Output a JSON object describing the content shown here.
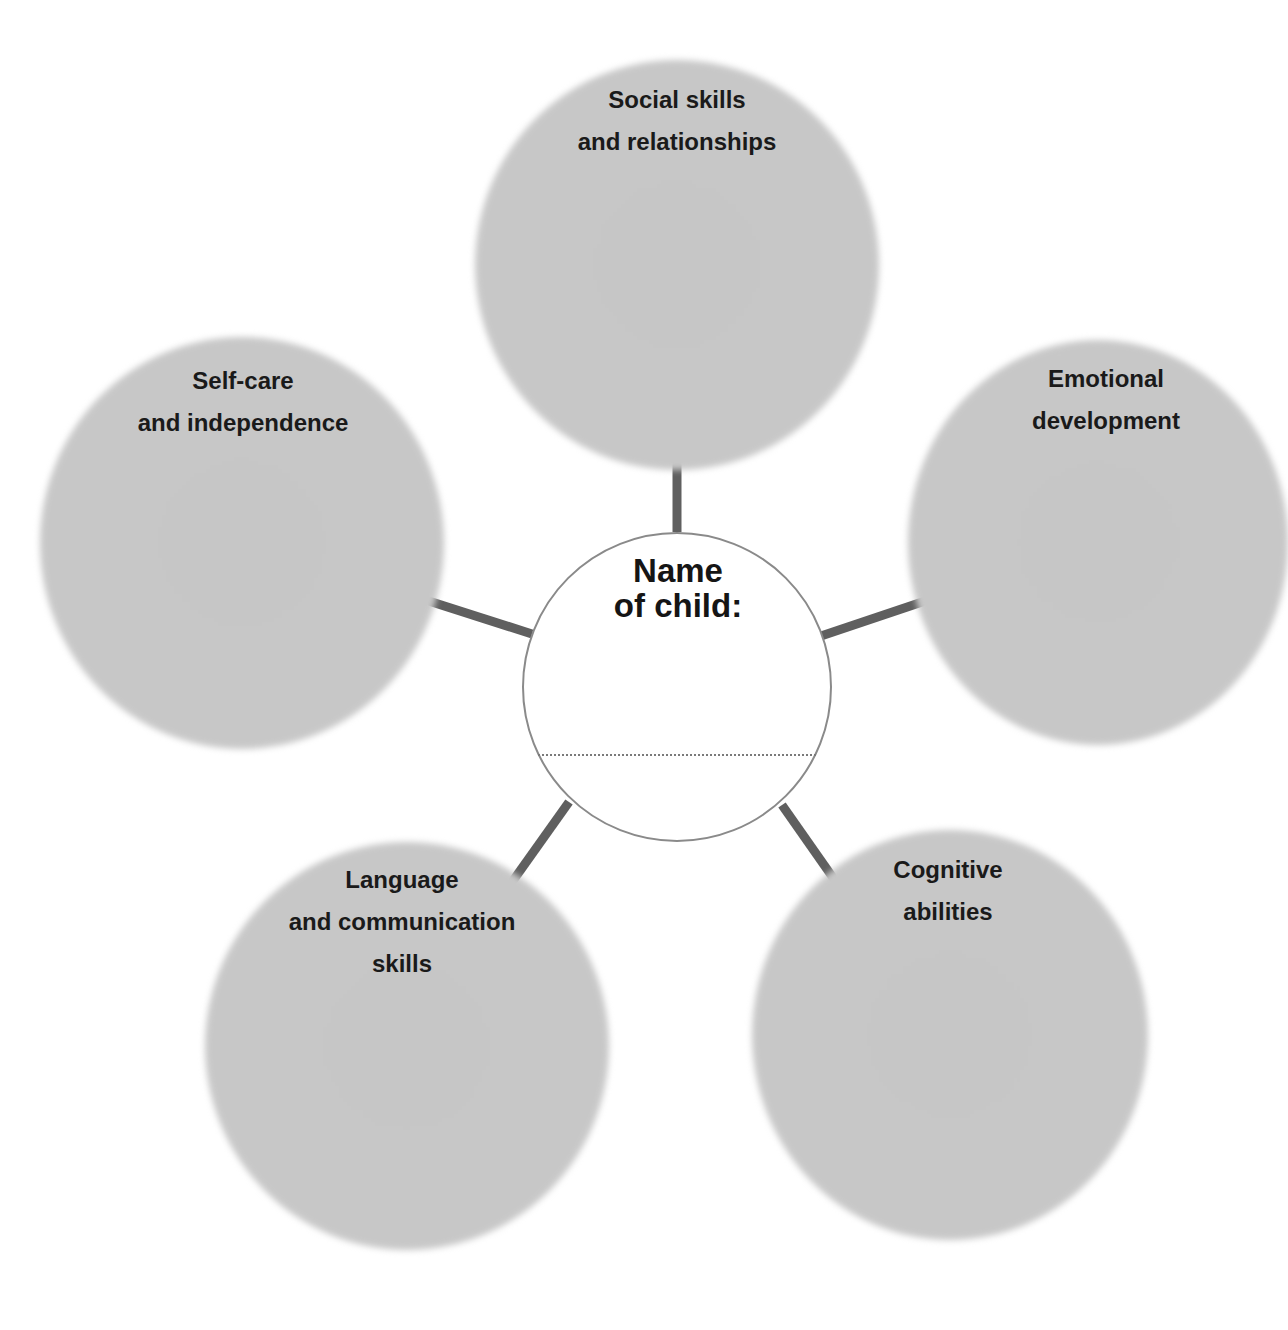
{
  "diagram": {
    "type": "mind-map worksheet",
    "center": {
      "title_lines": [
        "Name",
        "of child:"
      ],
      "name_value": "",
      "border_color": "#8a8a8a",
      "fill_color": "#ffffff"
    },
    "bubble_fill_color": "#c8c8c8",
    "spoke_color": "#666666",
    "text_color": "#1a1a1a",
    "bubbles": [
      {
        "id": "social",
        "label_lines": [
          "Social skills",
          "and relationships"
        ]
      },
      {
        "id": "emotional",
        "label_lines": [
          "Emotional",
          "development"
        ]
      },
      {
        "id": "cognitive",
        "label_lines": [
          "Cognitive",
          "abilities"
        ]
      },
      {
        "id": "language",
        "label_lines": [
          "Language",
          "and communication",
          "skills"
        ]
      },
      {
        "id": "selfcare",
        "label_lines": [
          "Self-care",
          "and independence"
        ]
      }
    ]
  }
}
